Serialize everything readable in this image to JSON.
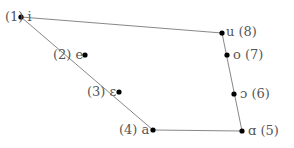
{
  "diagram": {
    "line_color": "#888888",
    "point_color": "#000000",
    "text_color": "#555555",
    "vowels": [
      {
        "index": "(1)",
        "symbol": "i",
        "label": "(1) i",
        "x": 21,
        "y": 17
      },
      {
        "index": "(2)",
        "symbol": "e",
        "label": "(2) e",
        "x": 85,
        "y": 55
      },
      {
        "index": "(3)",
        "symbol": "ε",
        "label": "(3) ε",
        "x": 119,
        "y": 92
      },
      {
        "index": "(4)",
        "symbol": "a",
        "label": "(4) a",
        "x": 153,
        "y": 130
      },
      {
        "index": "(5)",
        "symbol": "ɑ",
        "label": "ɑ (5)",
        "x": 242,
        "y": 131
      },
      {
        "index": "(6)",
        "symbol": "ɔ",
        "label": "ɔ (6)",
        "x": 234,
        "y": 94
      },
      {
        "index": "(7)",
        "symbol": "o",
        "label": "o (7)",
        "x": 227,
        "y": 55
      },
      {
        "index": "(8)",
        "symbol": "u",
        "label": "u (8)",
        "x": 222,
        "y": 33
      }
    ]
  }
}
